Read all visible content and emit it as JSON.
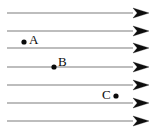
{
  "figure": {
    "name": "uniform-field-lines-diagram",
    "width": 157,
    "height": 138,
    "background_color": "#ffffff",
    "line_color": "#7d7d7d",
    "arrow_color": "#0d0d0d",
    "marker_color": "#0a0a0a",
    "label_color": "#0a0a0a"
  },
  "field_lines": [
    {
      "id": "field-line-1",
      "x_start": 7,
      "x_end": 133,
      "y": 13
    },
    {
      "id": "field-line-2",
      "x_start": 7,
      "x_end": 133,
      "y": 31
    },
    {
      "id": "field-line-3",
      "x_start": 7,
      "x_end": 133,
      "y": 48
    },
    {
      "id": "field-line-4",
      "x_start": 7,
      "x_end": 133,
      "y": 67
    },
    {
      "id": "field-line-5",
      "x_start": 7,
      "x_end": 133,
      "y": 85
    },
    {
      "id": "field-line-6",
      "x_start": 7,
      "x_end": 133,
      "y": 103
    },
    {
      "id": "field-line-7",
      "x_start": 7,
      "x_end": 133,
      "y": 121
    }
  ],
  "arrow_heads": [
    {
      "id": "arrow-head-1",
      "x": 133,
      "y": 13
    },
    {
      "id": "arrow-head-2",
      "x": 133,
      "y": 31
    },
    {
      "id": "arrow-head-3",
      "x": 133,
      "y": 48
    },
    {
      "id": "arrow-head-4",
      "x": 133,
      "y": 67
    },
    {
      "id": "arrow-head-5",
      "x": 133,
      "y": 85
    },
    {
      "id": "arrow-head-6",
      "x": 133,
      "y": 103
    },
    {
      "id": "arrow-head-7",
      "x": 133,
      "y": 121
    }
  ],
  "points": [
    {
      "id": "point-a",
      "label": "A",
      "dot_x": 24,
      "dot_y": 42,
      "dot_r": 2.6,
      "label_x": 29,
      "label_y": 33
    },
    {
      "id": "point-b",
      "label": "B",
      "dot_x": 54,
      "dot_y": 67,
      "dot_r": 2.6,
      "label_x": 58,
      "label_y": 55
    },
    {
      "id": "point-c",
      "label": "C",
      "dot_x": 116,
      "dot_y": 96,
      "dot_r": 2.6,
      "label_x": 102,
      "label_y": 88
    }
  ]
}
